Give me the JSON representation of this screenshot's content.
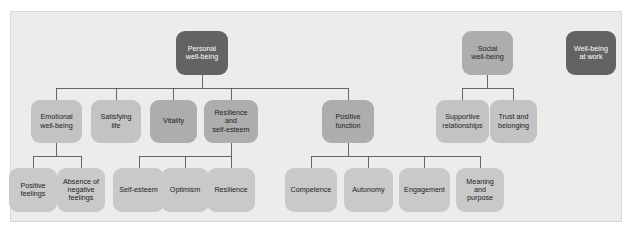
{
  "diagram": {
    "type": "tree",
    "palette": {
      "panel_background": "#ececeb",
      "panel_border": "#d8d8d6",
      "page_background": "#ffffff",
      "connector_line": "#58585a",
      "node_dark": "#636363",
      "node_mid": "#adadad",
      "node_light": "#c3c3c3",
      "node_pale": "#c9c9c9",
      "text_on_dark": "#ffffff",
      "text_on_light": "#1d1d1d"
    },
    "roots": [
      {
        "id": "personal-well-being",
        "label": "Personal\nwell-being",
        "tone": "dark"
      },
      {
        "id": "social-well-being",
        "label": "Social\nwell-being",
        "tone": "mid"
      },
      {
        "id": "well-being-at-work",
        "label": "Well-being\nat work",
        "tone": "dark"
      }
    ],
    "level2": [
      {
        "id": "emotional-well-being",
        "label": "Emotional\nwell-being",
        "tone": "light",
        "parent": "personal-well-being"
      },
      {
        "id": "satisfying-life",
        "label": "Satisfying\nlife",
        "tone": "light",
        "parent": "personal-well-being"
      },
      {
        "id": "vitality",
        "label": "Vitality",
        "tone": "mid",
        "parent": "personal-well-being"
      },
      {
        "id": "resilience-and-self-esteem",
        "label": "Resilience\nand\nself-esteem",
        "tone": "mid",
        "parent": "personal-well-being"
      },
      {
        "id": "positive-function",
        "label": "Positive\nfunction",
        "tone": "mid",
        "parent": "personal-well-being"
      },
      {
        "id": "supportive-relationships",
        "label": "Supportive\nrelationships",
        "tone": "light",
        "parent": "social-well-being"
      },
      {
        "id": "trust-and-belonging",
        "label": "Trust and\nbelonging",
        "tone": "light",
        "parent": "social-well-being"
      }
    ],
    "level3": [
      {
        "id": "positive-feelings",
        "label": "Positive\nfeelings",
        "tone": "pale",
        "parent": "emotional-well-being"
      },
      {
        "id": "absence-of-negative-feelings",
        "label": "Absence of\nnegative\nfeelings",
        "tone": "pale",
        "parent": "emotional-well-being"
      },
      {
        "id": "self-esteem",
        "label": "Self-esteem",
        "tone": "pale",
        "parent": "resilience-and-self-esteem"
      },
      {
        "id": "optimism",
        "label": "Optimism",
        "tone": "pale",
        "parent": "resilience-and-self-esteem"
      },
      {
        "id": "resilience",
        "label": "Resilience",
        "tone": "pale",
        "parent": "resilience-and-self-esteem"
      },
      {
        "id": "competence",
        "label": "Competence",
        "tone": "pale",
        "parent": "positive-function"
      },
      {
        "id": "autonomy",
        "label": "Autonomy",
        "tone": "pale",
        "parent": "positive-function"
      },
      {
        "id": "engagement",
        "label": "Engagement",
        "tone": "pale",
        "parent": "positive-function"
      },
      {
        "id": "meaning-and-purpose",
        "label": "Meaning\nand\npurpose",
        "tone": "pale",
        "parent": "positive-function"
      }
    ]
  }
}
